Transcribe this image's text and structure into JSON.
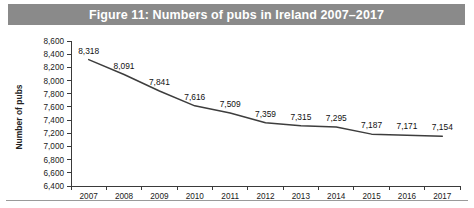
{
  "figure": {
    "title": "Figure 11: Numbers of pubs in Ireland 2007–2017",
    "title_band_color": "#8a8a8a",
    "title_text_color": "#ffffff"
  },
  "chart_data": {
    "type": "line",
    "title": "Figure 11: Numbers of pubs in Ireland 2007–2017",
    "xlabel": "",
    "ylabel": "Number of pubs",
    "categories": [
      "2007",
      "2008",
      "2009",
      "2010",
      "2011",
      "2012",
      "2013",
      "2014",
      "2015",
      "2016",
      "2017"
    ],
    "values": [
      8318,
      8091,
      7841,
      7616,
      7509,
      7359,
      7315,
      7295,
      7187,
      7171,
      7154
    ],
    "point_labels": [
      "8,318",
      "8,091",
      "7,841",
      "7,616",
      "7,509",
      "7,359",
      "7,315",
      "7,295",
      "7,187",
      "7,171",
      "7,154"
    ],
    "ylim": [
      6400,
      8600
    ],
    "ytick_values": [
      8600,
      8400,
      8200,
      8000,
      7800,
      7600,
      7400,
      7200,
      7000,
      6800,
      6600,
      6400
    ],
    "ytick_labels": [
      "8,600",
      "8,400",
      "8,200",
      "8,000",
      "7,800",
      "7,600",
      "7,400",
      "7,200",
      "7,000",
      "6,800",
      "6,600",
      "6,400"
    ],
    "grid": false,
    "legend": false,
    "series_color": "#3d3d3d",
    "axis_color": "#3a3a3a"
  }
}
